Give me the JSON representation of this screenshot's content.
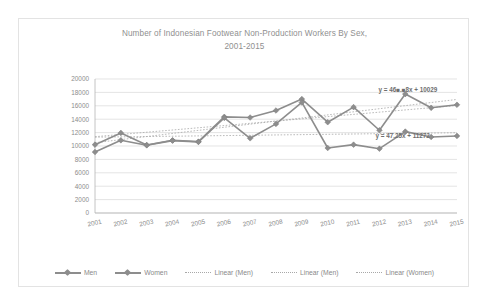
{
  "chart_data": {
    "type": "line",
    "title": "Number of Indonesian Footwear Non-Production Workers By Sex, 2001-2015",
    "title_line1": "Number of Indonesian Footwear Non-Production Workers By Sex,",
    "title_line2": "2001-2015",
    "xlabel": "",
    "ylabel": "",
    "categories": [
      "2001",
      "2002",
      "2003",
      "2004",
      "2005",
      "2006",
      "2007",
      "2008",
      "2009",
      "2010",
      "2011",
      "2012",
      "2013",
      "2014",
      "2015"
    ],
    "ylim": [
      0,
      20000
    ],
    "yticks": [
      "0",
      "2000",
      "4000",
      "6000",
      "8000",
      "10000",
      "12000",
      "14000",
      "16000",
      "18000",
      "20000"
    ],
    "grid": true,
    "legend_position": "bottom",
    "series": [
      {
        "name": "Men",
        "values": [
          10200,
          11950,
          10150,
          10850,
          10650,
          14350,
          14250,
          15300,
          17000,
          13550,
          15800,
          12350,
          17750,
          15700,
          16150
        ]
      },
      {
        "name": "Women",
        "values": [
          9100,
          10850,
          10100,
          10800,
          10600,
          14200,
          11150,
          13300,
          16500,
          9700,
          10200,
          9600,
          12150,
          11350,
          11500
        ]
      }
    ],
    "trendlines": [
      {
        "name": "Linear (Men)",
        "equation": "y = 46■.■8x + 10029",
        "slope": 461.38,
        "intercept": 10029,
        "label_x": 2013.1,
        "label_y": 18050
      },
      {
        "name": "Linear (Women)",
        "equation": "y = 47.25x + 11272",
        "slope": 47.25,
        "intercept": 11272,
        "label_x": 2012.9,
        "label_y": 11150
      }
    ],
    "legend": [
      {
        "label": "Men",
        "style": "solid-marker"
      },
      {
        "label": "Women",
        "style": "solid-marker"
      },
      {
        "label": "Linear (Men)",
        "style": "dotted"
      },
      {
        "label": "Linear (Men)",
        "style": "dotted"
      },
      {
        "label": "Linear (Women)",
        "style": "dotted"
      }
    ],
    "colors": {
      "series_line": "#8d8d8d",
      "trend_line": "#a8a8a8",
      "grid": "#d9d9d9",
      "text": "#8c8c8c",
      "frame": "#e3e3e3",
      "background": "#ffffff"
    }
  }
}
